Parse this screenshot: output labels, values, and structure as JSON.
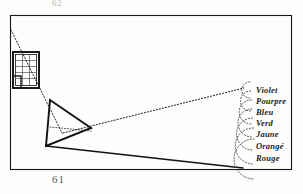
{
  "figure": {
    "title_alt": "Newton prism experiment plate",
    "page_number_top": "62",
    "page_number_bottom": "61",
    "frame": {
      "x": 10,
      "y": 15,
      "width": 282,
      "height": 155,
      "stroke": "#171716",
      "stroke_width": 1.1
    },
    "background_color": "#fdfdfc",
    "ink_color": "#171716"
  },
  "window": {
    "name": "window-aperture",
    "x": 14,
    "y": 53,
    "width": 24,
    "height": 34,
    "columns": 3,
    "rows": 5,
    "frame_stroke": "#1b1b1a",
    "pane_stroke": "#4d4d4a"
  },
  "prism": {
    "name": "glass-prism",
    "vertices": [
      {
        "x": 50,
        "y": 100
      },
      {
        "x": 91,
        "y": 128
      },
      {
        "x": 46,
        "y": 146
      }
    ],
    "stroke": "#121211",
    "stroke_width": 1.8
  },
  "rays": {
    "incident_dotted": {
      "name": "incident-sunbeam-ray",
      "x1": 11,
      "y1": 30,
      "x2": 62,
      "y2": 133,
      "style": "dotted"
    },
    "refracted_dotted_upper": {
      "name": "refracted-violet-ray",
      "x1": 63,
      "y1": 133,
      "x2": 244,
      "y2": 88,
      "style": "dotted"
    },
    "refracted_solid_lower": {
      "name": "refracted-red-ray",
      "x1": 46,
      "y1": 146,
      "x2": 243,
      "y2": 168,
      "style": "solid"
    },
    "internal_dotted": {
      "name": "internal-prism-ray",
      "x1": 50,
      "y1": 128,
      "x2": 91,
      "y2": 131,
      "style": "dotted"
    }
  },
  "spectrum": {
    "name": "spectrum-color-arcs",
    "arc_style": "dotted",
    "arc_stroke": "#46463f",
    "bands": [
      {
        "label": "Violet",
        "cy": 90,
        "radius": 8,
        "label_x": 256,
        "label_y": 85
      },
      {
        "label": "Pourpre",
        "cy": 101,
        "radius": 10,
        "label_x": 256,
        "label_y": 96
      },
      {
        "label": "Bleu",
        "cy": 112,
        "radius": 12,
        "label_x": 256,
        "label_y": 107
      },
      {
        "label": "Verd",
        "cy": 123,
        "radius": 14,
        "label_x": 256,
        "label_y": 118
      },
      {
        "label": "Jaune",
        "cy": 134,
        "radius": 16,
        "label_x": 256,
        "label_y": 129
      },
      {
        "label": "Orangé",
        "cy": 146,
        "radius": 18,
        "label_x": 256,
        "label_y": 141
      },
      {
        "label": "Rouge",
        "cy": 159,
        "radius": 20,
        "label_x": 256,
        "label_y": 153
      }
    ],
    "arc_center_x": 247
  }
}
